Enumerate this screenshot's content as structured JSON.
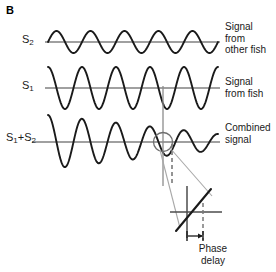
{
  "figure": {
    "panel_label": "B",
    "background_color": "#ffffff",
    "wave_color": "#1a1a1a",
    "axis_color": "#808080",
    "leader_color": "#9a9a9a",
    "dash_color": "#808080",
    "text_color": "#1a1a1a"
  },
  "traces": [
    {
      "id": "s2",
      "label_base": "S",
      "label_sub": "2",
      "description": "Signal\nfrom\nother fish"
    },
    {
      "id": "s1",
      "label_base": "S",
      "label_sub": "1",
      "description": "Signal\nfrom fish"
    },
    {
      "id": "s1_plus_s2",
      "label_base": "S",
      "label_sub": "1",
      "label_base2": "+S",
      "label_sub2": "2",
      "description": "Combined\nsignal"
    }
  ],
  "inset": {
    "caption": "Phase\ndelay"
  },
  "chart_data": {
    "type": "line",
    "title": "",
    "xlabel": "",
    "ylabel": "",
    "grid": false,
    "legend_position": "right",
    "series": [
      {
        "name": "S2",
        "label": "Signal from other fish",
        "baseline_y": 42,
        "amplitude": 11,
        "cycles": 5,
        "phase_deg": 0,
        "x_start": 48,
        "x_end": 218
      },
      {
        "name": "S1",
        "label": "Signal from fish",
        "baseline_y": 88,
        "amplitude": 21,
        "cycles": 5,
        "phase_deg": 90,
        "x_start": 48,
        "x_end": 218
      },
      {
        "name": "S1+S2",
        "label": "Combined signal",
        "baseline_y": 142,
        "amplitude_start": 27,
        "amplitude_end": 8,
        "cycles": 5,
        "phase_deg": 90,
        "x_start": 48,
        "x_end": 218,
        "note": "amplitude-modulated beat envelope, decreasing left to right"
      }
    ],
    "annotations": [
      {
        "name": "zero-crossing-marker",
        "type": "circle",
        "cx": 163,
        "cy": 142,
        "r": 9
      },
      {
        "name": "reference-line",
        "type": "vertical-line",
        "x": 163,
        "y_top": 86,
        "y_bottom": 185
      },
      {
        "name": "phase-delay-marker",
        "type": "dashed-vertical-line",
        "x": 172,
        "y_top": 142,
        "y_bottom": 182
      },
      {
        "name": "inset-axes",
        "type": "crosshair",
        "cx": 196,
        "cy": 212
      },
      {
        "name": "phase-delay-arrow",
        "type": "double-tick-arrow",
        "x_from": 187,
        "x_to": 203,
        "y": 236
      }
    ]
  }
}
